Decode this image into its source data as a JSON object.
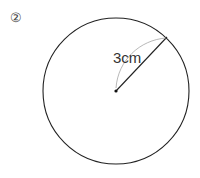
{
  "problem": {
    "number_label": "②",
    "radius_label": "3cm"
  },
  "figure": {
    "type": "circle",
    "center": [
      116,
      91
    ],
    "radius_px": 73,
    "radius_endpoint": [
      167,
      37
    ],
    "stroke_color": "#222222",
    "arc_color": "#999999"
  }
}
